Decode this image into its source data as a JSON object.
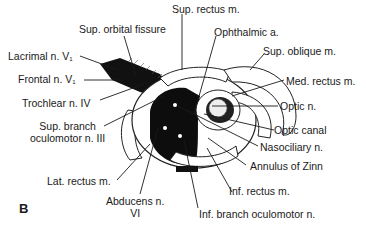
{
  "figure": {
    "panel_letter": "B",
    "labels": {
      "sup_rectus": "Sup. rectus m.",
      "sup_orbital_fissure": "Sup. orbital fissure",
      "ophthalmic_a": "Ophthalmic a.",
      "sup_oblique": "Sup. oblique m.",
      "lacrimal": "Lacrimal n. V",
      "lacrimal_sub": "1",
      "frontal": "Frontal n. V",
      "frontal_sub": "1",
      "med_rectus": "Med. rectus m.",
      "trochlear": "Trochlear n. IV",
      "optic_n": "Optic n.",
      "optic_canal": "Optic canal",
      "sup_branch_1": "Sup. branch",
      "sup_branch_2": "oculomotor n. III",
      "nasociliary": "Nasociliary n.",
      "annulus": "Annulus of Zinn",
      "lat_rectus": "Lat. rectus m.",
      "inf_rectus": "Inf. rectus m.",
      "abducens_1": "Abducens n.",
      "abducens_2": "VI",
      "inf_branch": "Inf. branch oculomotor n."
    }
  }
}
